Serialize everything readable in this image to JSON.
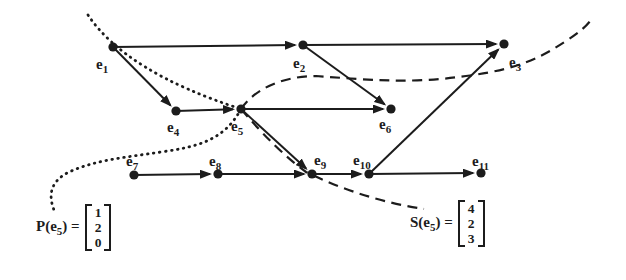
{
  "colors": {
    "ink": "#1c1c1c",
    "background": "#ffffff"
  },
  "diagram": {
    "nodes": [
      {
        "id": "e1",
        "label": "e",
        "sub": "1",
        "x": 113,
        "y": 47,
        "lx": 96,
        "ly": 69
      },
      {
        "id": "e2",
        "label": "e",
        "sub": "2",
        "x": 303,
        "y": 45,
        "lx": 293,
        "ly": 68
      },
      {
        "id": "e3",
        "label": "e",
        "sub": "3",
        "x": 504,
        "y": 44,
        "lx": 509,
        "ly": 67
      },
      {
        "id": "e4",
        "label": "e",
        "sub": "4",
        "x": 176,
        "y": 111,
        "lx": 167,
        "ly": 132
      },
      {
        "id": "e5",
        "label": "e",
        "sub": "5",
        "x": 241,
        "y": 109,
        "lx": 231,
        "ly": 131
      },
      {
        "id": "e6",
        "label": "e",
        "sub": "6",
        "x": 391,
        "y": 109,
        "lx": 379,
        "ly": 129
      },
      {
        "id": "e7",
        "label": "e",
        "sub": "7",
        "x": 134,
        "y": 175,
        "lx": 126,
        "ly": 166
      },
      {
        "id": "e8",
        "label": "e",
        "sub": "8",
        "x": 218,
        "y": 174,
        "lx": 209,
        "ly": 166
      },
      {
        "id": "e9",
        "label": "e",
        "sub": "9",
        "x": 312,
        "y": 174,
        "lx": 314,
        "ly": 165
      },
      {
        "id": "e10",
        "label": "e",
        "sub": "10",
        "x": 369,
        "y": 174,
        "lx": 353,
        "ly": 165
      },
      {
        "id": "e11",
        "label": "e",
        "sub": "11",
        "x": 481,
        "y": 173,
        "lx": 472,
        "ly": 166
      }
    ],
    "edges": [
      {
        "from": "e1",
        "to": "e2"
      },
      {
        "from": "e1",
        "to": "e4"
      },
      {
        "from": "e2",
        "to": "e3"
      },
      {
        "from": "e2",
        "to": "e6"
      },
      {
        "from": "e4",
        "to": "e5"
      },
      {
        "from": "e5",
        "to": "e6"
      },
      {
        "from": "e5",
        "to": "e9"
      },
      {
        "from": "e7",
        "to": "e8"
      },
      {
        "from": "e8",
        "to": "e9"
      },
      {
        "from": "e9",
        "to": "e10"
      },
      {
        "from": "e10",
        "to": "e11"
      },
      {
        "from": "e10",
        "to": "e3"
      }
    ],
    "curves": [
      {
        "name": "past-cone-upper",
        "style": "dotted",
        "path": "M 88 15 Q 126 72 241 109"
      },
      {
        "name": "past-cone-lower",
        "style": "dotted",
        "path": "M 241 109 C 224 141 196 147 161 152 C 121 158 96 160 69 172 C 53 180 47 192 54 210"
      },
      {
        "name": "future-cone-upper",
        "style": "dashed",
        "path": "M 241 109 C 256 87 286 76 316 76 C 371 80 411 84 466 76 C 521 69 543 56 566 41 C 580 32 588 25 593 17"
      },
      {
        "name": "future-cone-lower",
        "style": "dashed",
        "path": "M 241 109 Q 276 150 306 172 Q 364 200 424 209"
      }
    ]
  },
  "annotations": {
    "past": {
      "prefix": "P(e",
      "sub": "5",
      "suffix": ") =",
      "values": [
        "1",
        "2",
        "0"
      ]
    },
    "future": {
      "prefix": "S(e",
      "sub": "5",
      "suffix": ") =",
      "values": [
        "4",
        "2",
        "3"
      ]
    }
  }
}
